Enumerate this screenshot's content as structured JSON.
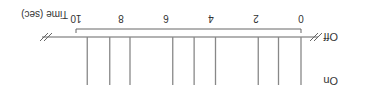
{
  "labels": {
    "on": "On",
    "off": "Off",
    "axis_title": "Time (sec)"
  },
  "axis": {
    "min": 0,
    "max": 10,
    "ticks": [
      "0",
      "2",
      "4",
      "6",
      "8",
      "10"
    ]
  },
  "chart_data": {
    "type": "scatter",
    "title": "",
    "xlabel": "Time (sec)",
    "ylabel": "",
    "xlim": [
      0,
      10
    ],
    "row_labels": [
      "On",
      "Off"
    ],
    "tick_labels": [
      "0",
      "2",
      "4",
      "6",
      "8",
      "10"
    ],
    "event_times": [
      0,
      1,
      1.9,
      3.8,
      4.75,
      5.7,
      7.6,
      8.5,
      9.5
    ],
    "colors": {
      "line": "#888888",
      "axis": "#666666"
    }
  }
}
